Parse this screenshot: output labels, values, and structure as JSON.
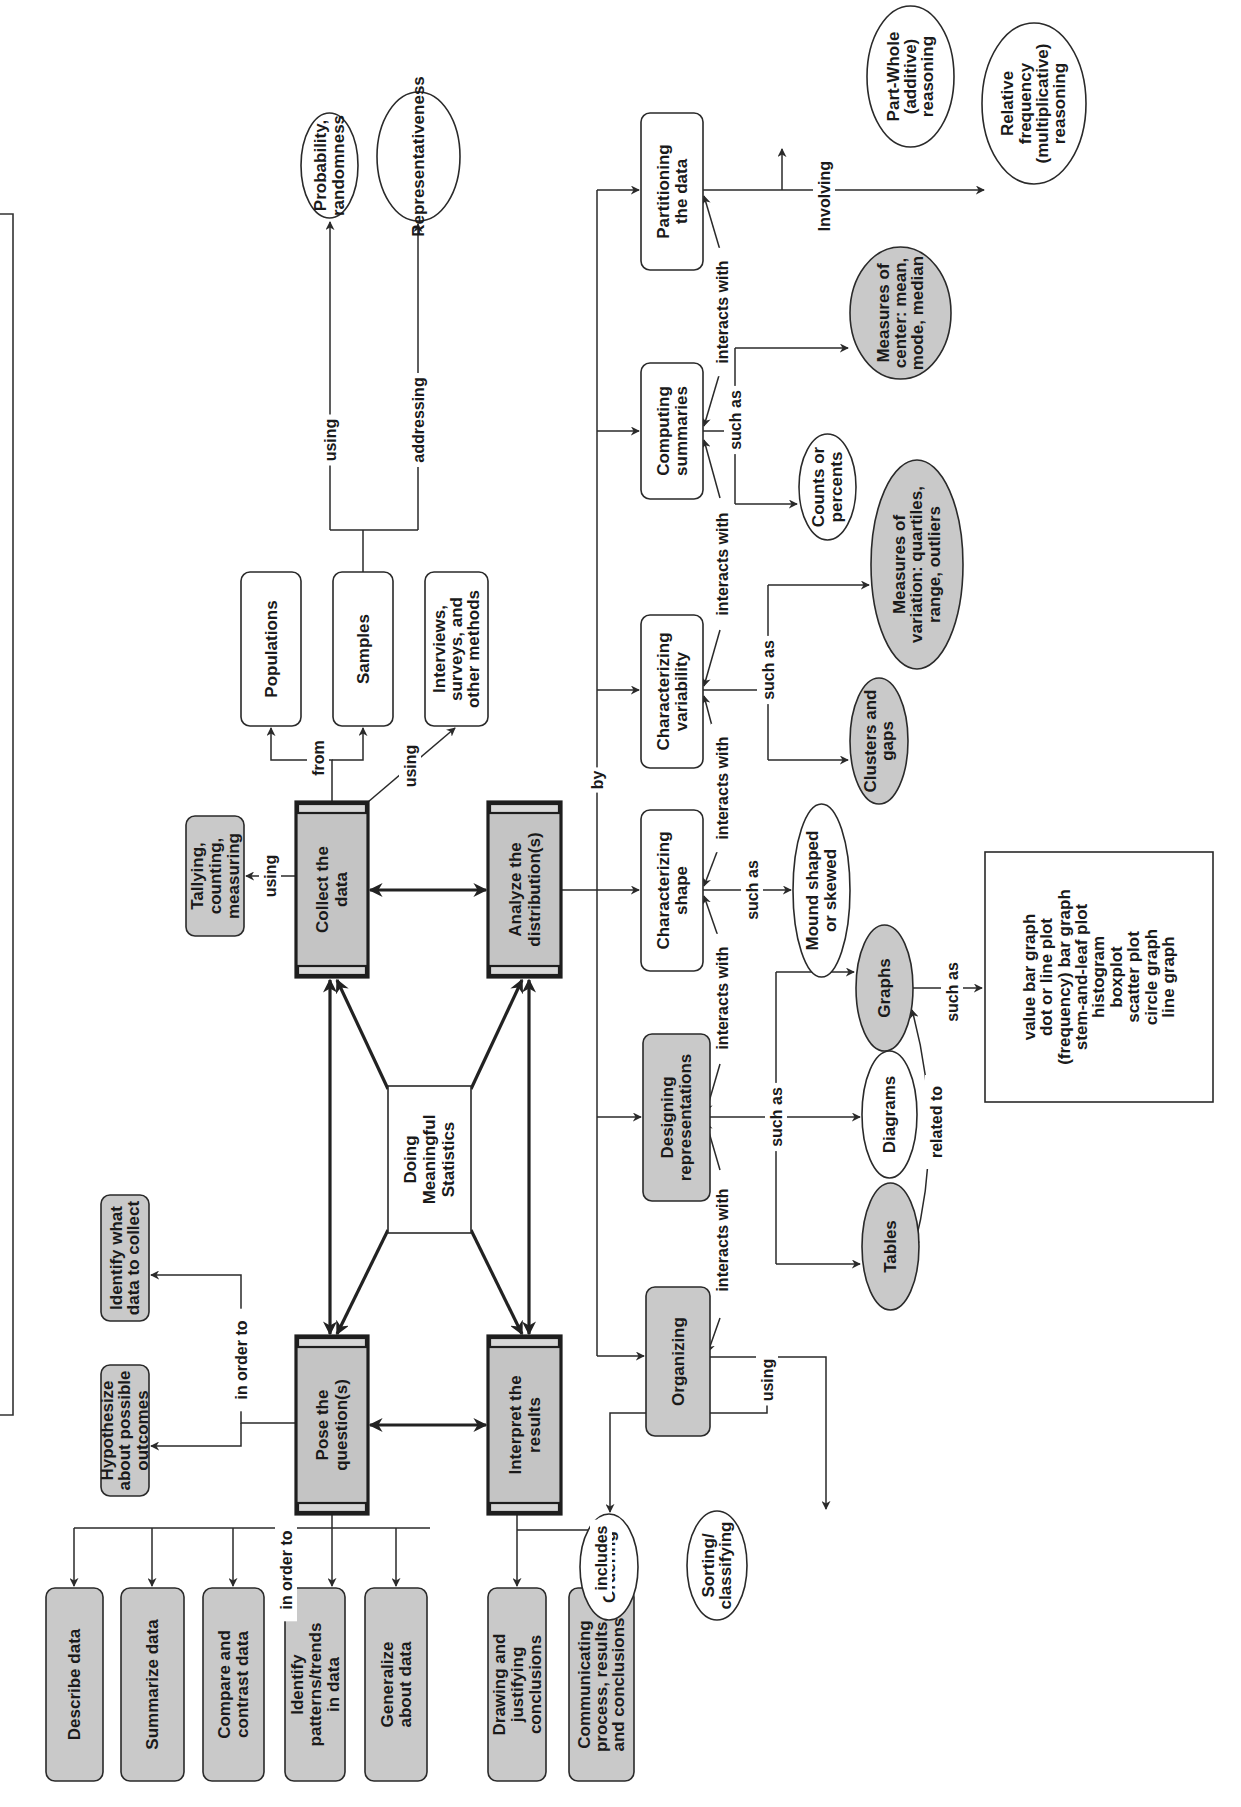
{
  "diagram": {
    "center": {
      "label": [
        "Doing",
        "Meaningful",
        "Statistics"
      ]
    },
    "core_steps": {
      "pose": {
        "label": [
          "Pose the",
          "question(s)"
        ]
      },
      "collect": {
        "label": [
          "Collect the",
          "data"
        ]
      },
      "analyze": {
        "label": [
          "Analyze the",
          "distribution(s)"
        ]
      },
      "interpret": {
        "label": [
          "Interpret the",
          "results"
        ]
      }
    },
    "pose_branches": {
      "in_order_to_label": "in order to",
      "hypothesize": {
        "label": [
          "Hypothesize",
          "about possible",
          "outcomes"
        ]
      },
      "identify_collect": {
        "label": [
          "Identify what",
          "data to collect"
        ]
      },
      "in_order_to_label_2": "in order to",
      "describe": {
        "label": [
          "Describe data"
        ]
      },
      "summarize": {
        "label": [
          "Summarize data"
        ]
      },
      "compare": {
        "label": [
          "Compare and",
          "contrast data"
        ]
      },
      "patterns": {
        "label": [
          "Identify",
          "patterns/trends",
          "in data"
        ]
      },
      "generalize": {
        "label": [
          "Generalize",
          "about data"
        ]
      }
    },
    "interpret_branches": {
      "includes_label": "includes",
      "drawing": {
        "label": [
          "Drawing and",
          "justifying",
          "conclusions"
        ]
      },
      "communicating": {
        "label": [
          "Communicating",
          "process, results,",
          "and conclusions"
        ]
      }
    },
    "collect_branches": {
      "using_label_tally": "using",
      "tallying": {
        "label": [
          "Tallying,",
          "counting,",
          "measuring"
        ]
      },
      "from_label": "from",
      "using_label_methods": "using",
      "populations": {
        "label": [
          "Populations"
        ]
      },
      "samples": {
        "label": [
          "Samples"
        ]
      },
      "interviews": {
        "label": [
          "Interviews,",
          "surveys, and",
          "other methods"
        ]
      },
      "using_label_prob": "using",
      "addressing_label": "addressing",
      "probability": {
        "label": [
          "Probability,",
          "randomness"
        ]
      },
      "representativeness": {
        "label": [
          "Representativeness"
        ]
      }
    },
    "analyze_branches": {
      "by_label": "by",
      "partitioning": {
        "label": [
          "Partitioning",
          "the data"
        ]
      },
      "computing": {
        "label": [
          "Computing",
          "summaries"
        ]
      },
      "variability": {
        "label": [
          "Characterizing",
          "variability"
        ]
      },
      "shape": {
        "label": [
          "Characterizing",
          "shape"
        ]
      },
      "designing": {
        "label": [
          "Designing",
          "representations"
        ]
      },
      "organizing": {
        "label": [
          "Organizing"
        ]
      },
      "involving_label": "Involving",
      "part_whole": {
        "label": [
          "Part-Whole",
          "(additive)",
          "reasoning"
        ]
      },
      "relative_freq": {
        "label": [
          "Relative",
          "frequency",
          "(multiplicative)",
          "reasoning"
        ]
      },
      "such_as_center": "such as",
      "measures_center": {
        "label": [
          "Measures of",
          "center: mean,",
          "mode, median"
        ]
      },
      "counts": {
        "label": [
          "Counts or",
          "percents"
        ]
      },
      "such_as_variation": "such as",
      "measures_variation": {
        "label": [
          "Measures of",
          "variation: quartiles,",
          "range, outliers"
        ]
      },
      "clusters": {
        "label": [
          "Clusters and",
          "gaps"
        ]
      },
      "such_as_shape": "such as",
      "mound": {
        "label": [
          "Mound shaped",
          "or skewed"
        ]
      },
      "such_as_repr": "such as",
      "graphs": {
        "label": [
          "Graphs"
        ]
      },
      "diagrams": {
        "label": [
          "Diagrams"
        ]
      },
      "tables": {
        "label": [
          "Tables"
        ]
      },
      "related_to_label": "related to",
      "such_as_graphs": "such as",
      "graph_types": {
        "label": [
          "value bar graph",
          "dot or line plot",
          "(frequency) bar graph",
          "stem-and-leaf plot",
          "histogram",
          "boxplot",
          "scatter plot",
          "circle graph",
          "line graph"
        ]
      },
      "using_label_org": "using",
      "ordering": {
        "label": [
          "Ordering"
        ]
      },
      "sorting": {
        "label": [
          "Sorting/",
          "classifying"
        ]
      },
      "interacts_with": "interacts with"
    }
  }
}
